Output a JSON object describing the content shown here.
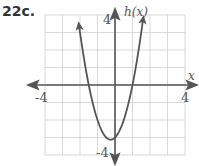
{
  "problem_label": "22c.",
  "chart_data": {
    "type": "line",
    "title": "",
    "function_label": "h(x)",
    "xlabel": "x",
    "ylabel": "h(x)",
    "xlim": [
      -4,
      4
    ],
    "ylim": [
      -4,
      4
    ],
    "grid": true,
    "grid_step": 1,
    "tick_labels": {
      "x": [
        "-4",
        "4"
      ],
      "y": [
        "4",
        "-4"
      ]
    },
    "curve": "parabola opening upward",
    "equation_estimate": "h(x) = 2x^2 + x - 3",
    "vertex": [
      -0.25,
      -3.1
    ],
    "x_intercepts": [
      -1.5,
      1
    ],
    "y_intercept": -3,
    "x": [
      -2.05,
      -1.5,
      -1,
      -0.5,
      -0.25,
      0,
      0.5,
      1,
      1.6
    ],
    "series": [
      {
        "name": "h(x)",
        "values": [
          3.35,
          0,
          -2,
          -3,
          -3.125,
          -3,
          -2,
          0,
          3.72
        ]
      }
    ],
    "colors": {
      "curve": "#555555",
      "axes": "#555555",
      "grid": "#cccccc"
    }
  }
}
